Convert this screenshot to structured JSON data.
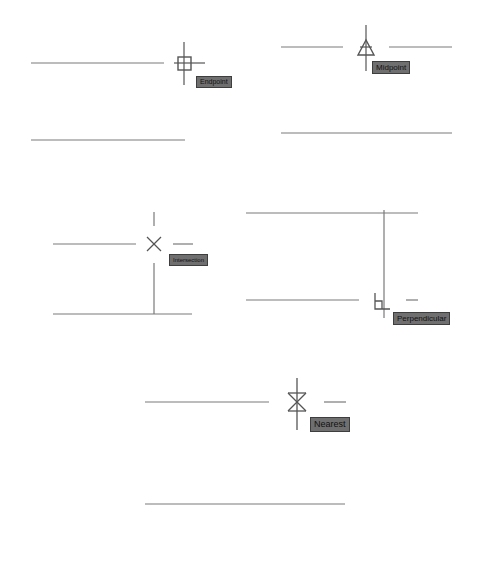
{
  "colors": {
    "background": "#ffffff",
    "line": "#7a7a7a",
    "marker": "#5a5a5a",
    "tooltip_bg": "#6f6f6f",
    "tooltip_text": "#111111"
  },
  "panels": [
    {
      "id": "endpoint",
      "tooltip": "Endpoint",
      "marker": "square"
    },
    {
      "id": "midpoint",
      "tooltip": "Midpoint",
      "marker": "triangle"
    },
    {
      "id": "intersection",
      "tooltip": "Intersection",
      "marker": "x"
    },
    {
      "id": "perpendicular",
      "tooltip": "Perpendicular",
      "marker": "right-angle"
    },
    {
      "id": "nearest",
      "tooltip": "Nearest",
      "marker": "hourglass"
    }
  ]
}
